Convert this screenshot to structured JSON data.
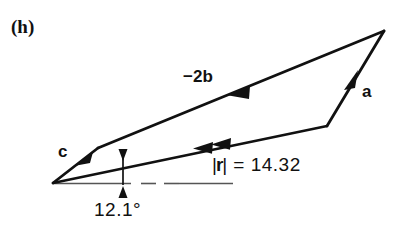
{
  "figure": {
    "panel_label": "(h)",
    "labels": {
      "vector_b": "−2b",
      "vector_a": "a",
      "vector_c": "c",
      "magnitude_bar_left": "|",
      "magnitude_symbol": "r",
      "magnitude_bar_right": "|",
      "magnitude_equation": "=  14.32",
      "magnitude_full": "|r|  =  14.32",
      "angle": "12.1°"
    },
    "values": {
      "resultant_magnitude": 14.32,
      "resultant_angle_deg": 12.1
    },
    "colors": {
      "ink": "#111111",
      "axis": "#555555",
      "background": "#ffffff"
    },
    "geometry": {
      "origin": [
        53,
        183
      ],
      "apex": [
        384,
        31
      ],
      "kink_a": [
        327,
        126
      ],
      "bend_c": [
        98,
        148
      ],
      "baseline_end": [
        233,
        183
      ],
      "angle_tick_x": 123
    }
  }
}
